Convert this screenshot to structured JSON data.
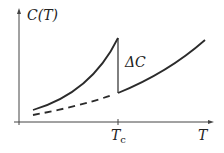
{
  "diagram": {
    "y_label": "C(T)",
    "x_label": "T",
    "tc_label": "T",
    "tc_sub": "c",
    "jump_label": "ΔC",
    "colors": {
      "line": "#2b2b2b",
      "background": "#ffffff"
    }
  }
}
